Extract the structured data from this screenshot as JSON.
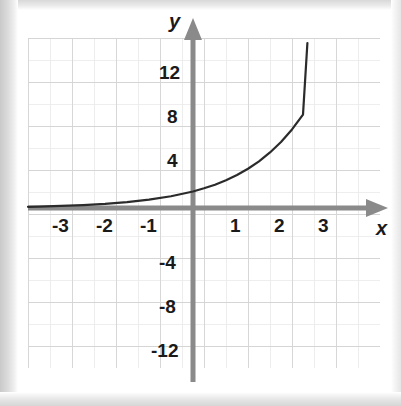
{
  "figure": {
    "kind": "coordinate-grid-graph",
    "background_color": "#ffffff",
    "grid_color": "#d9d9d9",
    "grid_minor_color": "#ebebeb",
    "axis_color": "#8a8a8a",
    "curve_color": "#2b2b2b",
    "label_color": "#1a1a1a"
  },
  "axes": {
    "x_name": "x",
    "y_name": "y",
    "x_ticks": [
      "-3",
      "-2",
      "-1",
      "1",
      "2",
      "3"
    ],
    "y_ticks": [
      "12",
      "8",
      "4",
      "-4",
      "-8",
      "-12"
    ]
  },
  "chart_data": {
    "type": "line",
    "title": "",
    "xlabel": "x",
    "ylabel": "y",
    "grid": true,
    "legend": "none",
    "xlim": [
      -3.75,
      4.2
    ],
    "ylim": [
      -14.6,
      15.4
    ],
    "xticks": [
      -3,
      -2,
      -1,
      1,
      2,
      3
    ],
    "yticks": [
      12,
      8,
      4,
      -4,
      -8,
      -12
    ],
    "xtick_labels": [
      "-3",
      "-2",
      "-1",
      "1",
      "2",
      "3"
    ],
    "ytick_labels": [
      "12",
      "8",
      "4",
      "-4",
      "-8",
      "-12"
    ],
    "annotations": [],
    "series": [
      {
        "name": "exponential curve",
        "description": "increasing exponential growth curve approaching y=0 asymptotically on the left and rising steeply to the right",
        "x": [
          -3.75,
          -3.5,
          -3.0,
          -2.5,
          -2.0,
          -1.5,
          -1.0,
          -0.5,
          0.0,
          0.25,
          0.5,
          0.75,
          1.0,
          1.25,
          1.5,
          1.75,
          2.0,
          2.25,
          2.5,
          2.6
        ],
        "y": [
          0.11,
          0.13,
          0.19,
          0.27,
          0.38,
          0.54,
          0.76,
          1.07,
          1.5,
          1.79,
          2.12,
          2.52,
          3.0,
          3.57,
          4.24,
          5.05,
          6.0,
          7.14,
          8.49,
          15.0
        ]
      }
    ]
  }
}
